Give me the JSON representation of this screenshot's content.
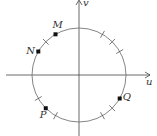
{
  "diagram": {
    "type": "unit-circle",
    "axes": {
      "horizontal_label": "u",
      "vertical_label": "v"
    },
    "center": [
      79,
      75
    ],
    "radius": 47,
    "tick_angles_deg": [
      30,
      45,
      60,
      135,
      210,
      240,
      300,
      315
    ],
    "points": [
      {
        "label": "M",
        "angle_deg": 120
      },
      {
        "label": "N",
        "angle_deg": 150
      },
      {
        "label": "P",
        "angle_deg": 225
      },
      {
        "label": "Q",
        "angle_deg": 330
      }
    ]
  }
}
